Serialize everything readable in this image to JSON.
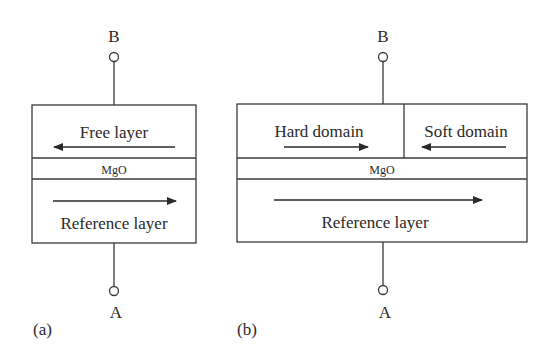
{
  "figure": {
    "colors": {
      "stroke": "#3a3a3a",
      "text": "#2a2a2a",
      "background": "#ffffff"
    },
    "panel_a": {
      "label": "(a)",
      "terminal_top": "B",
      "terminal_bottom": "A",
      "layers": {
        "free": {
          "label": "Free layer",
          "arrow": "left"
        },
        "barrier": {
          "label": "MgO"
        },
        "reference": {
          "label": "Reference layer",
          "arrow": "right"
        }
      }
    },
    "panel_b": {
      "label": "(b)",
      "terminal_top": "B",
      "terminal_bottom": "A",
      "layers": {
        "hard_domain": {
          "label": "Hard domain",
          "arrow": "right"
        },
        "soft_domain": {
          "label": "Soft domain",
          "arrow": "left"
        },
        "barrier": {
          "label": "MgO"
        },
        "reference": {
          "label": "Reference layer",
          "arrow": "right"
        }
      }
    }
  }
}
